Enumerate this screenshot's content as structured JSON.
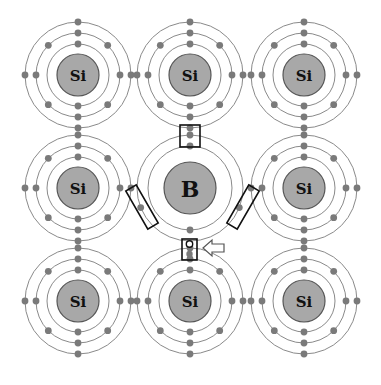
{
  "caption_fragment": "",
  "diagram": {
    "grid": {
      "cols": [
        78,
        190,
        304
      ],
      "rows": [
        75,
        188,
        301
      ]
    },
    "atoms": [
      {
        "id": "si-top-left",
        "label": "Si",
        "cx": 78,
        "cy": 75,
        "type": "Si"
      },
      {
        "id": "si-top-center",
        "label": "Si",
        "cx": 190,
        "cy": 75,
        "type": "Si"
      },
      {
        "id": "si-top-right",
        "label": "Si",
        "cx": 304,
        "cy": 75,
        "type": "Si"
      },
      {
        "id": "si-mid-left",
        "label": "Si",
        "cx": 78,
        "cy": 188,
        "type": "Si"
      },
      {
        "id": "b-center",
        "label": "B",
        "cx": 190,
        "cy": 188,
        "type": "B"
      },
      {
        "id": "si-mid-right",
        "label": "Si",
        "cx": 304,
        "cy": 188,
        "type": "Si"
      },
      {
        "id": "si-bottom-left",
        "label": "Si",
        "cx": 78,
        "cy": 301,
        "type": "Si"
      },
      {
        "id": "si-bottom-center",
        "label": "Si",
        "cx": 190,
        "cy": 301,
        "type": "Si"
      },
      {
        "id": "si-bottom-right",
        "label": "Si",
        "cx": 304,
        "cy": 301,
        "type": "Si"
      }
    ],
    "si_geometry": {
      "nucleus_r": 21,
      "ring_r": [
        31,
        42,
        53
      ]
    },
    "b_geometry": {
      "nucleus_r": 26,
      "ring_r": [
        42,
        53
      ]
    },
    "highlights": [
      {
        "id": "bond-box-top",
        "shape": "rect"
      },
      {
        "id": "bond-box-left",
        "shape": "rotated-rect"
      },
      {
        "id": "bond-box-right",
        "shape": "rotated-rect"
      },
      {
        "id": "hole-box-bottom",
        "shape": "rect",
        "contains": "hole"
      }
    ],
    "annotation": {
      "arrow_points_to": "hole",
      "hole_symbol": "o"
    },
    "colors": {
      "nucleus": "#a8a8a8",
      "electron": "#7a7a7a",
      "ring": "#8a8a8a",
      "highlight": "#111111"
    }
  }
}
